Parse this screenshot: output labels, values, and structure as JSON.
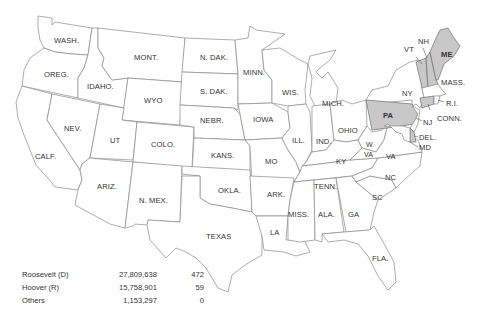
{
  "map": {
    "colors": {
      "roosevelt": "#ffffff",
      "hoover": "#c8c8c8",
      "border": "#8a8a8a"
    },
    "states": [
      {
        "id": "wash",
        "label": "WASH.",
        "winner": "D"
      },
      {
        "id": "oreg",
        "label": "OREG.",
        "winner": "D"
      },
      {
        "id": "calf",
        "label": "CALF.",
        "winner": "D"
      },
      {
        "id": "idaho",
        "label": "IDAHO.",
        "winner": "D"
      },
      {
        "id": "nev",
        "label": "NEV.",
        "winner": "D"
      },
      {
        "id": "mont",
        "label": "MONT.",
        "winner": "D"
      },
      {
        "id": "wyo",
        "label": "WYO",
        "winner": "D"
      },
      {
        "id": "ut",
        "label": "UT",
        "winner": "D"
      },
      {
        "id": "ariz",
        "label": "ARIZ.",
        "winner": "D"
      },
      {
        "id": "colo",
        "label": "COLO.",
        "winner": "D"
      },
      {
        "id": "nmex",
        "label": "N. MEX.",
        "winner": "D"
      },
      {
        "id": "ndak",
        "label": "N. DAK.",
        "winner": "D"
      },
      {
        "id": "sdak",
        "label": "S. DAK.",
        "winner": "D"
      },
      {
        "id": "nebr",
        "label": "NEBR.",
        "winner": "D"
      },
      {
        "id": "kans",
        "label": "KANS.",
        "winner": "D"
      },
      {
        "id": "okla",
        "label": "OKLA.",
        "winner": "D"
      },
      {
        "id": "texas",
        "label": "TEXAS",
        "winner": "D"
      },
      {
        "id": "minn",
        "label": "MINN.",
        "winner": "D"
      },
      {
        "id": "iowa",
        "label": "IOWA",
        "winner": "D"
      },
      {
        "id": "mo",
        "label": "MO",
        "winner": "D"
      },
      {
        "id": "ark",
        "label": "ARK.",
        "winner": "D"
      },
      {
        "id": "la",
        "label": "LA",
        "winner": "D"
      },
      {
        "id": "wis",
        "label": "WIS.",
        "winner": "D"
      },
      {
        "id": "ill",
        "label": "ILL.",
        "winner": "D"
      },
      {
        "id": "mich",
        "label": "MICH.",
        "winner": "D"
      },
      {
        "id": "ind",
        "label": "IND.",
        "winner": "D"
      },
      {
        "id": "ohio",
        "label": "OHIO",
        "winner": "D"
      },
      {
        "id": "ky",
        "label": "KY",
        "winner": "D"
      },
      {
        "id": "tenn",
        "label": "TENN.",
        "winner": "D"
      },
      {
        "id": "miss",
        "label": "MISS.",
        "winner": "D"
      },
      {
        "id": "ala",
        "label": "ALA.",
        "winner": "D"
      },
      {
        "id": "ga",
        "label": "GA",
        "winner": "D"
      },
      {
        "id": "fla",
        "label": "FLA.",
        "winner": "D"
      },
      {
        "id": "sc",
        "label": "SC",
        "winner": "D"
      },
      {
        "id": "nc",
        "label": "NC",
        "winner": "D"
      },
      {
        "id": "va",
        "label": "VA",
        "winner": "D"
      },
      {
        "id": "wva",
        "label": "W.\nVA",
        "winner": "D"
      },
      {
        "id": "md",
        "label": "MD",
        "winner": "D"
      },
      {
        "id": "del",
        "label": "DEL.",
        "winner": "R"
      },
      {
        "id": "nj",
        "label": "NJ",
        "winner": "D"
      },
      {
        "id": "pa",
        "label": "PA",
        "winner": "R"
      },
      {
        "id": "ny",
        "label": "NY",
        "winner": "D"
      },
      {
        "id": "conn",
        "label": "CONN.",
        "winner": "R"
      },
      {
        "id": "ri",
        "label": "R.I.",
        "winner": "D"
      },
      {
        "id": "mass",
        "label": "MASS.",
        "winner": "D"
      },
      {
        "id": "vt",
        "label": "VT",
        "winner": "R"
      },
      {
        "id": "nh",
        "label": "NH",
        "winner": "R"
      },
      {
        "id": "me",
        "label": "ME",
        "winner": "R"
      }
    ]
  },
  "legend": {
    "rows": [
      {
        "candidate": "Roosevelt (D)",
        "popular_vote": "27,809,638",
        "electoral_vote": "472"
      },
      {
        "candidate": "Hoover (R)",
        "popular_vote": "15,758,901",
        "electoral_vote": "59"
      },
      {
        "candidate": "Others",
        "popular_vote": "1,153,297",
        "electoral_vote": "0"
      }
    ]
  },
  "labels": {
    "wash": "WASH.",
    "oreg": "OREG.",
    "calf": "CALF.",
    "idaho": "IDAHO.",
    "nev": "NEV.",
    "mont": "MONT.",
    "wyo": "WYO",
    "ut": "UT",
    "ariz": "ARIZ.",
    "colo": "COLO.",
    "nmex": "N. MEX.",
    "ndak": "N. DAK.",
    "sdak": "S. DAK.",
    "nebr": "NEBR.",
    "kans": "KANS.",
    "okla": "OKLA.",
    "texas": "TEXAS",
    "minn": "MINN.",
    "iowa": "IOWA",
    "mo": "MO",
    "ark": "ARK.",
    "la": "LA",
    "wis": "WIS.",
    "ill": "ILL.",
    "mich": "MICH.",
    "ind": "IND.",
    "ohio": "OHIO",
    "ky": "KY",
    "tenn": "TENN.",
    "miss": "MISS.",
    "ala": "ALA.",
    "ga": "GA",
    "fla": "FLA.",
    "sc": "SC",
    "nc": "NC",
    "va": "VA",
    "wva1": "W.",
    "wva2": "VA",
    "md": "MD",
    "del": "DEL.",
    "nj": "NJ",
    "pa": "PA",
    "ny": "NY",
    "conn": "CONN.",
    "ri": "R.I.",
    "mass": "MASS.",
    "vt": "VT",
    "nh": "NH",
    "me": "ME"
  }
}
